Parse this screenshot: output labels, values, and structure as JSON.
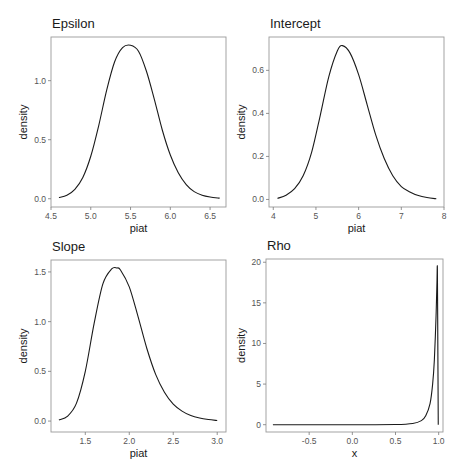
{
  "chart_data": [
    {
      "type": "line",
      "title": "Epsilon",
      "xlabel": "piat",
      "ylabel": "density",
      "xlim": [
        4.5,
        6.7
      ],
      "ylim": [
        -0.07,
        1.37
      ],
      "xticks": [
        4.5,
        5.0,
        5.5,
        6.0,
        6.5
      ],
      "xtick_labels": [
        "4.5",
        "5.0",
        "5.5",
        "6.0",
        "6.5"
      ],
      "yticks": [
        0.0,
        0.5,
        1.0
      ],
      "ytick_labels": [
        "0.0",
        "0.5",
        "1.0"
      ],
      "grid": false,
      "series": [
        {
          "name": "density",
          "x": [
            4.6,
            4.7,
            4.8,
            4.9,
            5.0,
            5.1,
            5.2,
            5.3,
            5.4,
            5.5,
            5.6,
            5.7,
            5.8,
            5.9,
            6.0,
            6.1,
            6.2,
            6.3,
            6.4,
            6.5,
            6.62
          ],
          "y": [
            0.01,
            0.03,
            0.08,
            0.18,
            0.36,
            0.62,
            0.92,
            1.16,
            1.28,
            1.3,
            1.25,
            1.08,
            0.84,
            0.58,
            0.37,
            0.22,
            0.12,
            0.06,
            0.03,
            0.015,
            0.005
          ]
        }
      ]
    },
    {
      "type": "line",
      "title": "Intercept",
      "xlabel": "piat",
      "ylabel": "density",
      "xlim": [
        3.9,
        8.0
      ],
      "ylim": [
        -0.035,
        0.755
      ],
      "xticks": [
        4,
        5,
        6,
        7,
        8
      ],
      "xtick_labels": [
        "4",
        "5",
        "6",
        "7",
        "8"
      ],
      "yticks": [
        0.0,
        0.2,
        0.4,
        0.6
      ],
      "ytick_labels": [
        "0.0",
        "0.2",
        "0.4",
        "0.6"
      ],
      "grid": false,
      "series": [
        {
          "name": "density",
          "x": [
            4.1,
            4.3,
            4.5,
            4.7,
            4.9,
            5.1,
            5.3,
            5.5,
            5.62,
            5.8,
            6.0,
            6.2,
            6.4,
            6.6,
            6.8,
            7.0,
            7.2,
            7.4,
            7.6,
            7.82
          ],
          "y": [
            0.005,
            0.02,
            0.05,
            0.11,
            0.22,
            0.39,
            0.57,
            0.69,
            0.715,
            0.68,
            0.58,
            0.44,
            0.3,
            0.19,
            0.11,
            0.06,
            0.035,
            0.018,
            0.009,
            0.003
          ]
        }
      ]
    },
    {
      "type": "line",
      "title": "Slope",
      "xlabel": "piat",
      "ylabel": "density",
      "xlim": [
        1.11,
        3.1
      ],
      "ylim": [
        -0.11,
        1.62
      ],
      "xticks": [
        1.5,
        2.0,
        2.5,
        3.0
      ],
      "xtick_labels": [
        "1.5",
        "2.0",
        "2.5",
        "3.0"
      ],
      "yticks": [
        0.0,
        0.5,
        1.0,
        1.5
      ],
      "ytick_labels": [
        "0.0",
        "0.5",
        "1.0",
        "1.5"
      ],
      "grid": false,
      "series": [
        {
          "name": "density",
          "x": [
            1.2,
            1.3,
            1.4,
            1.5,
            1.6,
            1.7,
            1.8,
            1.86,
            1.9,
            2.0,
            2.1,
            2.2,
            2.3,
            2.4,
            2.5,
            2.6,
            2.7,
            2.8,
            2.9,
            3.0
          ],
          "y": [
            0.01,
            0.05,
            0.18,
            0.5,
            0.98,
            1.38,
            1.53,
            1.54,
            1.52,
            1.35,
            1.05,
            0.73,
            0.47,
            0.29,
            0.17,
            0.1,
            0.055,
            0.03,
            0.015,
            0.005
          ]
        }
      ]
    },
    {
      "type": "line",
      "title": "Rho",
      "xlabel": "x",
      "ylabel": "density",
      "xlim": [
        -1.0,
        1.05
      ],
      "ylim": [
        -0.9,
        20.4
      ],
      "xticks": [
        -0.5,
        0.0,
        0.5,
        1.0
      ],
      "xtick_labels": [
        "-0.5",
        "0.0",
        "0.5",
        "1.0"
      ],
      "yticks": [
        0,
        5,
        10,
        15,
        20
      ],
      "ytick_labels": [
        "0",
        "5",
        "10",
        "15",
        "20"
      ],
      "grid": false,
      "series": [
        {
          "name": "density",
          "x": [
            -0.92,
            -0.5,
            0.0,
            0.5,
            0.7,
            0.8,
            0.85,
            0.9,
            0.93,
            0.95,
            0.97,
            0.98,
            0.985,
            0.99,
            0.995
          ],
          "y": [
            0.0,
            0.0,
            0.0,
            0.02,
            0.15,
            0.5,
            1.1,
            2.6,
            5.0,
            8.0,
            13.5,
            17.5,
            19.2,
            10.0,
            0.0
          ]
        }
      ]
    }
  ]
}
